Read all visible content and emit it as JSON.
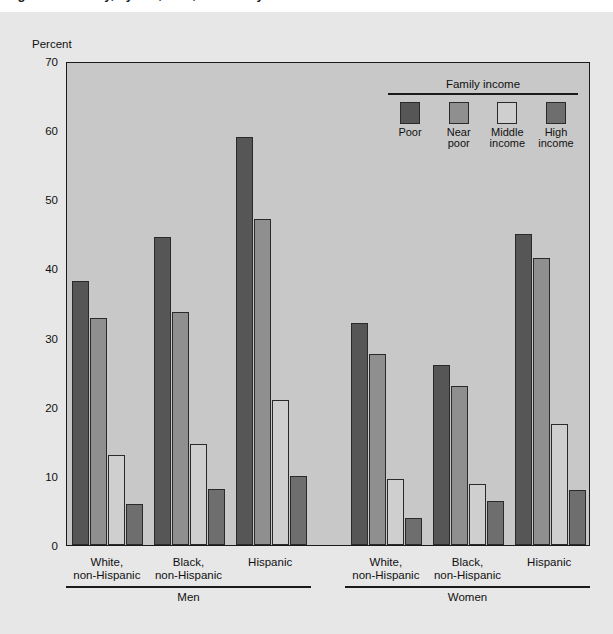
{
  "figure": {
    "clipped_title": "Figure 2. Obesity, by sex, race, and family income",
    "y_axis_label": "Percent"
  },
  "legend": {
    "title": "Family income",
    "items": [
      {
        "label_line1": "Poor",
        "label_line2": "",
        "color": "#565656"
      },
      {
        "label_line1": "Near",
        "label_line2": "poor",
        "color": "#8f8f8f"
      },
      {
        "label_line1": "Middle",
        "label_line2": "income",
        "color": "#cfcfcf"
      },
      {
        "label_line1": "High",
        "label_line2": "income",
        "color": "#6e6e6e"
      }
    ]
  },
  "axis": {
    "ticks": [
      0,
      10,
      20,
      30,
      40,
      50,
      60,
      70
    ]
  },
  "groups": {
    "sex_labels": [
      "Men",
      "Women"
    ],
    "race_labels_line1": [
      "White,",
      "Black,",
      "Hispanic"
    ],
    "race_labels_line2": [
      "non-Hispanic",
      "non-Hispanic",
      ""
    ]
  },
  "chart_data": {
    "type": "bar",
    "title": "Obesity, by sex, race, and family income",
    "xlabel": "",
    "ylabel": "Percent",
    "ylim": [
      0,
      70
    ],
    "ytick_step": 10,
    "grid": false,
    "legend_position": "top-right",
    "legend_title": "Family income",
    "categories": [
      "Men - White, non-Hispanic",
      "Men - Black, non-Hispanic",
      "Men - Hispanic",
      "Women - White, non-Hispanic",
      "Women - Black, non-Hispanic",
      "Women - Hispanic"
    ],
    "series": [
      {
        "name": "Poor",
        "color": "#565656",
        "values": [
          38.2,
          44.6,
          59.0,
          32.1,
          26.0,
          45.0
        ]
      },
      {
        "name": "Near poor",
        "color": "#8f8f8f",
        "values": [
          32.9,
          33.7,
          47.1,
          27.6,
          23.0,
          41.5
        ]
      },
      {
        "name": "Middle income",
        "color": "#cfcfcf",
        "values": [
          13.0,
          14.6,
          21.0,
          9.6,
          8.8,
          17.5
        ]
      },
      {
        "name": "High income",
        "color": "#6e6e6e",
        "values": [
          5.9,
          8.1,
          10.0,
          3.9,
          6.3,
          7.9
        ]
      }
    ]
  }
}
